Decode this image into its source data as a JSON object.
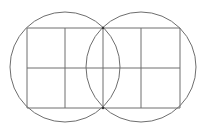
{
  "diagram": {
    "width": 206,
    "height": 133,
    "background": "#ffffff",
    "stroke_color": "#6e6e6e",
    "stroke_width": 1,
    "circles": [
      {
        "name": "left-circle",
        "cx": 65,
        "cy": 67,
        "r": 55
      },
      {
        "name": "right-circle",
        "cx": 141,
        "cy": 67,
        "r": 55
      }
    ],
    "grid": {
      "x": 27,
      "y": 28,
      "width": 153,
      "height": 80,
      "columns": 4,
      "rows": 2,
      "vertical_lines_x": [
        27,
        65,
        103,
        141,
        180
      ],
      "horizontal_lines_y": [
        28,
        68,
        108
      ]
    },
    "intersection_points": [
      {
        "x": 103,
        "y": 28
      },
      {
        "x": 103,
        "y": 108
      }
    ]
  }
}
